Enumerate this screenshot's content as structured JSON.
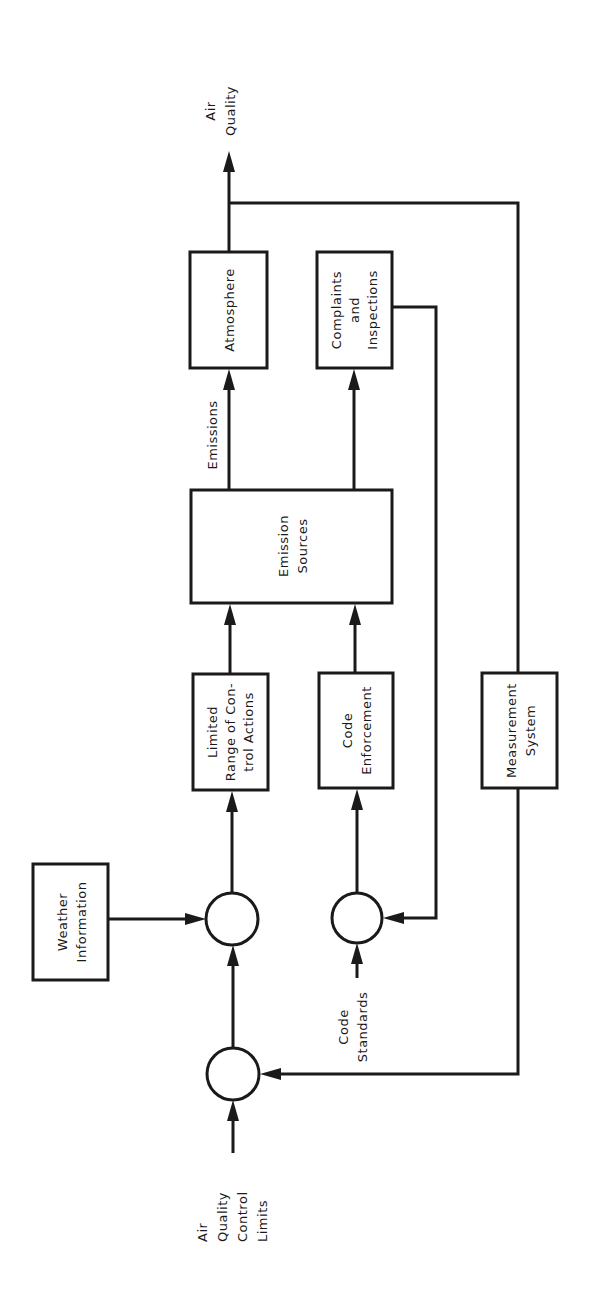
{
  "diagram": {
    "type": "block-diagram",
    "orientation": "rotated-90-ccw",
    "colors": {
      "stroke": "#1a1a1a",
      "background": "#ffffff"
    },
    "output": {
      "label_line1": "Air",
      "label_line2": "Quality"
    },
    "blocks": {
      "atmosphere": {
        "line1": "Atmosphere"
      },
      "complaints": {
        "line1": "Complaints",
        "line2": "and",
        "line3": "Inspections"
      },
      "emission_sources": {
        "line1": "Emission",
        "line2": "Sources"
      },
      "limited_range": {
        "line1": "Limited",
        "line2": "Range of Con-",
        "line3": "trol Actions"
      },
      "code_enforcement": {
        "line1": "Code",
        "line2": "Enforcement"
      },
      "measurement": {
        "line1": "Measurement",
        "line2": "System"
      },
      "weather": {
        "line1": "Weather",
        "line2": "Information"
      }
    },
    "edge_labels": {
      "emissions": "Emissions",
      "code_standards_line1": "Code",
      "code_standards_line2": "Standards"
    },
    "input": {
      "line1": "Air",
      "line2": "Quality",
      "line3": "Control",
      "line4": "Limits"
    },
    "summing_junctions": [
      "control-limits-junction",
      "weather-junction",
      "code-junction"
    ]
  }
}
